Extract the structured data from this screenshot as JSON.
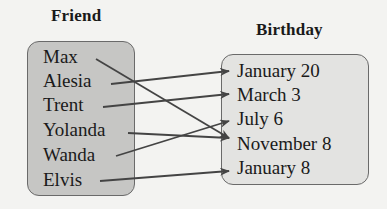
{
  "domain": "Diagram",
  "friend": {
    "title": "Friend",
    "items": [
      "Max",
      "Alesia",
      "Trent",
      "Yolanda",
      "Wanda",
      "Elvis"
    ]
  },
  "birthday": {
    "title": "Birthday",
    "items": [
      "January 20",
      "March 3",
      "July 6",
      "November 8",
      "January 8"
    ]
  },
  "mapping": [
    {
      "from": "Max",
      "to": "November 8"
    },
    {
      "from": "Alesia",
      "to": "January 20"
    },
    {
      "from": "Trent",
      "to": "March 3"
    },
    {
      "from": "Yolanda",
      "to": "November 8"
    },
    {
      "from": "Wanda",
      "to": "July 6"
    },
    {
      "from": "Elvis",
      "to": "January 8"
    }
  ],
  "colors": {
    "arrow": "#444444",
    "friend_box": "#c6c6c4",
    "birthday_box": "#e3e3e1",
    "background": "#f3f3f1"
  }
}
